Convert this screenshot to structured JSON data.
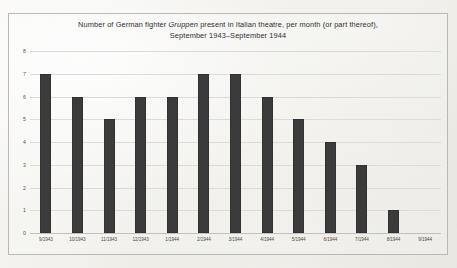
{
  "chart_data": {
    "type": "bar",
    "title": "Number of German fighter Gruppen present in Italian theatre, per month (or part thereof), September 1943–September 1944",
    "title_line1_pre": "Number of German fighter ",
    "title_line1_em": "Gruppen",
    "title_line1_post": " present in Italian theatre, per month (or part thereof),",
    "title_line2": "September 1943–September 1944",
    "xlabel": "",
    "ylabel": "",
    "categories": [
      "9/1943",
      "10/1943",
      "11/1943",
      "12/1943",
      "1/1944",
      "2/1944",
      "3/1944",
      "4/1944",
      "5/1944",
      "6/1944",
      "7/1944",
      "8/1944",
      "9/1944"
    ],
    "values": [
      7,
      6,
      5,
      6,
      6,
      7,
      7,
      6,
      5,
      4,
      3,
      1,
      0
    ],
    "ylim": [
      0,
      8
    ],
    "yticks": [
      "0",
      "1",
      "2",
      "3",
      "4",
      "5",
      "6",
      "7",
      "8"
    ],
    "grid": true,
    "legend": "none",
    "bar_color": "#3b3b3b",
    "gridline_color": "#dcdbd6",
    "background_color": "#f2f1ee",
    "border_color": "#b9b8b4"
  }
}
